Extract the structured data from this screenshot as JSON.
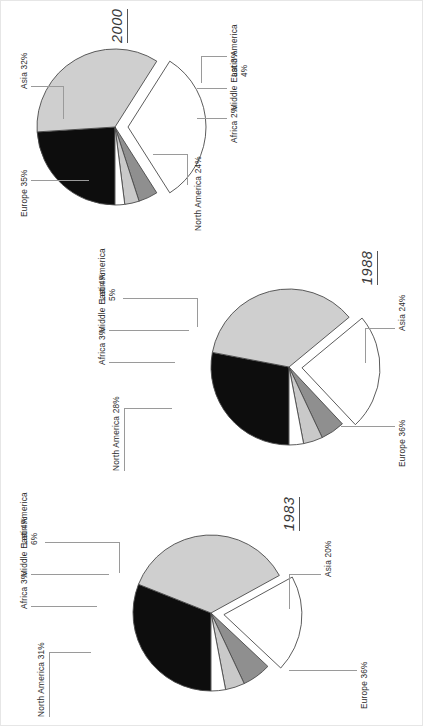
{
  "figure": {
    "orientation": "rotated-90-ccw",
    "background": "#ffffff",
    "slice_colors": {
      "north_america": "#0d0d0d",
      "europe": "#cfcfcf",
      "asia": "#ffffff",
      "latin_america": "#8f8f8f",
      "middle_east": "#c9c9c9",
      "africa": "#ffffff",
      "outline": "#4a4a4a",
      "leader_line": "#9a9a9a"
    }
  },
  "chart_data": [
    {
      "type": "pie",
      "title": "1983",
      "categories": [
        "North America",
        "Europe",
        "Asia",
        "Latin America",
        "Middle East",
        "Africa"
      ],
      "values": [
        31,
        36,
        20,
        6,
        4,
        3
      ],
      "labels": [
        "North America 31%",
        "Europe 36%",
        "Asia 20%",
        "Latin America 6%",
        "Middle East 4%",
        "Africa 3%"
      ],
      "exploded": [
        "Asia"
      ],
      "legend": "none",
      "grid": false
    },
    {
      "type": "pie",
      "title": "1988",
      "categories": [
        "North America",
        "Europe",
        "Asia",
        "Latin America",
        "Middle East",
        "Africa"
      ],
      "values": [
        28,
        36,
        24,
        5,
        4,
        3
      ],
      "labels": [
        "North America 28%",
        "Europe 36%",
        "Asia 24%",
        "Latin America 5%",
        "Middle East 4%",
        "Africa 3%"
      ],
      "exploded": [
        "Asia"
      ],
      "legend": "none",
      "grid": false
    },
    {
      "type": "pie",
      "title": "2000",
      "categories": [
        "North America",
        "Europe",
        "Asia",
        "Latin America",
        "Middle East",
        "Africa"
      ],
      "values": [
        24,
        35,
        32,
        4,
        3,
        2
      ],
      "labels": [
        "North America 24%",
        "Europe 35%",
        "Asia 32%",
        "Latin America 4%",
        "Middle East 3%",
        "Africa 2%"
      ],
      "exploded": [
        "Asia"
      ],
      "legend": "none",
      "grid": false
    }
  ],
  "charts": {
    "c2000": {
      "year": "2000",
      "north_america": "North America 24%",
      "africa": "Africa 2%",
      "middle_east": "Middle East 3%",
      "latin_america": "Latin America",
      "latin_america_pct": "4%",
      "asia": "Asia 32%",
      "europe": "Europe 35%"
    },
    "c1983": {
      "year": "1983",
      "north_america": "North America 31%",
      "africa": "Africa 3%",
      "middle_east": "Middle East 4%",
      "latin_america": "Latin America",
      "latin_america_pct": "6%",
      "asia": "Asia 20%",
      "europe": "Europe 36%"
    },
    "c1988": {
      "year": "1988",
      "north_america": "North America 28%",
      "africa": "Africa 3%",
      "middle_east": "Middle East 4%",
      "latin_america": "Latin America",
      "latin_america_pct": "5%",
      "asia": "Asia 24%",
      "europe": "Europe 36%"
    }
  }
}
